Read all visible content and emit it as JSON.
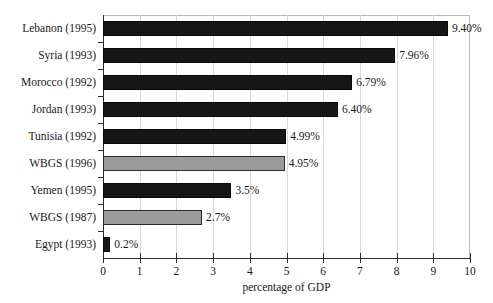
{
  "chart_data": {
    "type": "bar",
    "orientation": "horizontal",
    "title": "",
    "xlabel": "percentage of GDP",
    "ylabel": "",
    "xlim": [
      0,
      10
    ],
    "xticks": [
      "0",
      "1",
      "2",
      "3",
      "4",
      "5",
      "6",
      "7",
      "8",
      "9",
      "10"
    ],
    "grid": "vertical",
    "legend": "none",
    "categories": [
      "Lebanon (1995)",
      "Syria (1993)",
      "Morocco (1992)",
      "Jordan (1993)",
      "Tunisia (1992)",
      "WBGS (1996)",
      "Yemen (1995)",
      "WBGS (1987)",
      "Egypt (1993)"
    ],
    "values": [
      9.4,
      7.96,
      6.79,
      6.4,
      4.99,
      4.95,
      3.5,
      2.7,
      0.2
    ],
    "value_labels": [
      "9.40%",
      "7.96%",
      "6.79%",
      "6.40%",
      "4.99%",
      "4.95%",
      "3.5%",
      "2.7%",
      "0.2%"
    ],
    "bar_styles": [
      "black",
      "black",
      "black",
      "black",
      "black",
      "gray",
      "black",
      "gray",
      "black"
    ],
    "colors": {
      "black_bar": "#161616",
      "gray_bar": "#9b9b9b",
      "bar_border": "#2b2b2b",
      "gridline": "#d8d8d8",
      "axis": "#2a2a2a",
      "text": "#1a1a1a",
      "background": "#fefefe"
    }
  }
}
